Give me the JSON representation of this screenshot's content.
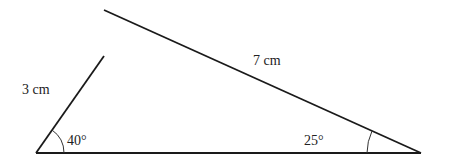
{
  "figure": {
    "type": "triangle-construction",
    "colors": {
      "line": "#1a1a1a",
      "text": "#222222",
      "background": "#ffffff"
    },
    "sides": {
      "left": {
        "label": "3 cm"
      },
      "top": {
        "label": "7 cm"
      }
    },
    "angles": {
      "bottom_left": {
        "label": "40°"
      },
      "bottom_right": {
        "label": "25°"
      }
    }
  }
}
